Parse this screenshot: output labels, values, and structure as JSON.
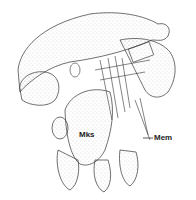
{
  "figure": {
    "type": "anatomical line drawing (stippled)",
    "labels": [
      {
        "id": "mks",
        "text": "Mks",
        "x": 79,
        "y": 136
      },
      {
        "id": "mem",
        "text": "Mem",
        "x": 154,
        "y": 135
      }
    ],
    "colors": {
      "ink": "#333333",
      "background": "#ffffff"
    }
  }
}
